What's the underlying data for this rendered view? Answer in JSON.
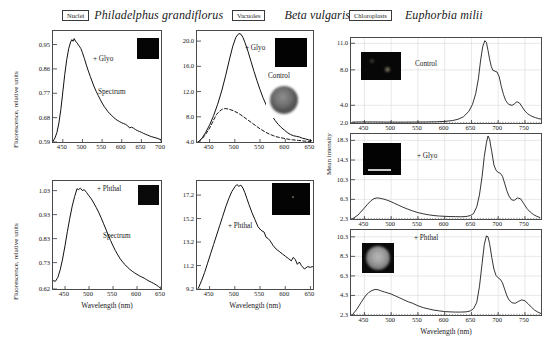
{
  "figure": {
    "columns": [
      {
        "tag": "Nuclei",
        "species": "Philadelphus grandiflorus"
      },
      {
        "tag": "Vacuoles",
        "species": "Beta vulgaris"
      },
      {
        "tag": "Chloroplasts",
        "species": "Euphorbia milii"
      }
    ],
    "axis_labels": {
      "x": "Wavelength (nm)",
      "y_left": "Fluorescence, relative units",
      "y_right": "Mean intensity"
    }
  },
  "chart_data": [
    {
      "id": "philadelphus-glyo",
      "type": "line",
      "title": "Nuclei — Philadelphus grandiflorus, + Glyo",
      "xlabel": "Wavelength (nm)",
      "ylabel": "Fluorescence, relative units",
      "xlim": [
        425,
        700
      ],
      "ylim": [
        0.59,
        1.0
      ],
      "xticks": [
        450,
        500,
        550,
        600,
        650,
        700
      ],
      "yticks": [
        0.59,
        0.68,
        0.77,
        0.86,
        0.95
      ],
      "grid": false,
      "annotations": [
        "+ Glyo",
        "Spectrum"
      ],
      "inset": {
        "kind": "dark-field",
        "label": ""
      },
      "series": [
        {
          "name": "+ Glyo",
          "style": "solid",
          "x": [
            425,
            430,
            435,
            440,
            445,
            450,
            455,
            460,
            465,
            470,
            473,
            476,
            479,
            482,
            485,
            488,
            492,
            496,
            500,
            505,
            510,
            515,
            520,
            525,
            530,
            535,
            540,
            545,
            550,
            555,
            560,
            565,
            570,
            575,
            580,
            585,
            590,
            595,
            600,
            605,
            610,
            615,
            620,
            625,
            630,
            635,
            640,
            645,
            650,
            655,
            660,
            665,
            670,
            675,
            680,
            685,
            690,
            695,
            700
          ],
          "y": [
            0.592,
            0.605,
            0.625,
            0.66,
            0.71,
            0.775,
            0.84,
            0.895,
            0.935,
            0.96,
            0.968,
            0.962,
            0.972,
            0.963,
            0.958,
            0.952,
            0.944,
            0.935,
            0.92,
            0.898,
            0.874,
            0.852,
            0.832,
            0.812,
            0.793,
            0.777,
            0.762,
            0.748,
            0.734,
            0.722,
            0.712,
            0.702,
            0.694,
            0.687,
            0.68,
            0.674,
            0.669,
            0.665,
            0.661,
            0.658,
            0.655,
            0.65,
            0.642,
            0.645,
            0.641,
            0.636,
            0.632,
            0.629,
            0.626,
            0.622,
            0.619,
            0.616,
            0.613,
            0.61,
            0.608,
            0.606,
            0.604,
            0.601,
            0.598
          ]
        }
      ]
    },
    {
      "id": "philadelphus-phthal",
      "type": "line",
      "title": "Nuclei — Philadelphus grandiflorus, + Phthal",
      "xlabel": "Wavelength (nm)",
      "ylabel": "Fluorescence, relative units",
      "xlim": [
        425,
        650
      ],
      "ylim": [
        0.62,
        1.07
      ],
      "xticks": [
        450,
        500,
        550,
        600,
        650
      ],
      "yticks": [
        0.62,
        0.73,
        0.83,
        0.93,
        1.03
      ],
      "grid": false,
      "annotations": [
        "+ Phthal",
        "Spectrum"
      ],
      "inset": {
        "kind": "dark-field",
        "label": ""
      },
      "series": [
        {
          "name": "+ Phthal",
          "style": "solid",
          "x": [
            425,
            430,
            435,
            440,
            445,
            450,
            455,
            460,
            465,
            470,
            475,
            478,
            482,
            486,
            490,
            495,
            500,
            505,
            510,
            515,
            520,
            525,
            530,
            535,
            540,
            545,
            550,
            555,
            560,
            565,
            570,
            575,
            580,
            585,
            590,
            595,
            600,
            605,
            610,
            615,
            620,
            625,
            630,
            635,
            640,
            645,
            650
          ],
          "y": [
            0.655,
            0.652,
            0.668,
            0.7,
            0.745,
            0.8,
            0.86,
            0.915,
            0.965,
            1.005,
            1.038,
            1.034,
            1.04,
            1.03,
            1.034,
            1.022,
            1.008,
            0.995,
            0.978,
            0.96,
            0.94,
            0.918,
            0.894,
            0.87,
            0.845,
            0.822,
            0.8,
            0.78,
            0.762,
            0.746,
            0.733,
            0.721,
            0.711,
            0.702,
            0.694,
            0.687,
            0.681,
            0.675,
            0.67,
            0.665,
            0.659,
            0.653,
            0.648,
            0.643,
            0.637,
            0.63,
            0.622
          ]
        }
      ]
    },
    {
      "id": "beta-glyo-control",
      "type": "line",
      "title": "Vacuoles — Beta vulgaris, + Glyo vs Control",
      "xlabel": "Wavelength (nm)",
      "ylabel": "",
      "xlim": [
        425,
        655
      ],
      "ylim": [
        4.0,
        21.6
      ],
      "xticks": [
        450,
        500,
        550,
        600,
        650
      ],
      "yticks": [
        4.0,
        8.0,
        12.0,
        16.0,
        20.0
      ],
      "grid": false,
      "annotations": [
        "+ Glyo",
        "Control"
      ],
      "inset": {
        "kind": "dark-field",
        "label": ""
      },
      "inset2": {
        "kind": "round-cell",
        "label": ""
      },
      "series": [
        {
          "name": "+ Glyo",
          "style": "solid",
          "x": [
            428,
            435,
            442,
            450,
            458,
            466,
            474,
            482,
            490,
            496,
            502,
            508,
            512,
            516,
            520,
            526,
            532,
            538,
            544,
            550,
            556,
            562,
            568,
            574,
            580,
            586,
            592,
            598,
            604,
            610,
            616,
            622,
            628,
            634,
            640,
            646,
            652
          ],
          "y": [
            4.05,
            4.6,
            5.5,
            6.7,
            8.2,
            10.0,
            12.1,
            14.6,
            17.3,
            19.2,
            20.6,
            21.2,
            21.1,
            20.6,
            19.8,
            18.4,
            16.8,
            15.2,
            13.7,
            12.3,
            11.0,
            9.9,
            8.9,
            8.1,
            7.4,
            6.8,
            6.3,
            5.9,
            5.5,
            5.2,
            5.0,
            4.9,
            4.8,
            4.6,
            4.5,
            4.35,
            4.2
          ]
        },
        {
          "name": "Control",
          "style": "dashed",
          "x": [
            428,
            435,
            442,
            450,
            458,
            464,
            470,
            476,
            482,
            488,
            494,
            500,
            506,
            512,
            518,
            524,
            530,
            536,
            542,
            548,
            554,
            560,
            566,
            572,
            578,
            584,
            590,
            596,
            602,
            608,
            614,
            620,
            626,
            632,
            638,
            644,
            650
          ],
          "y": [
            4.05,
            4.5,
            5.2,
            6.2,
            7.5,
            8.4,
            8.9,
            9.25,
            9.3,
            9.2,
            9.05,
            8.85,
            8.6,
            8.3,
            7.95,
            7.6,
            7.25,
            6.9,
            6.55,
            6.2,
            5.9,
            5.6,
            5.35,
            5.15,
            4.95,
            4.8,
            4.7,
            4.6,
            4.5,
            4.42,
            4.35,
            4.3,
            4.25,
            4.2,
            4.15,
            4.12,
            4.1
          ]
        }
      ]
    },
    {
      "id": "beta-phthal",
      "type": "line",
      "title": "Vacuoles — Beta vulgaris, + Phthal",
      "xlabel": "Wavelength (nm)",
      "ylabel": "",
      "xlim": [
        425,
        655
      ],
      "ylim": [
        9.2,
        18.4
      ],
      "xticks": [
        450,
        500,
        550,
        600,
        650
      ],
      "yticks": [
        9.2,
        11.2,
        13.2,
        15.2,
        17.2
      ],
      "grid": false,
      "annotations": [
        "+ Phthal"
      ],
      "inset": {
        "kind": "dark-field-dot",
        "label": ""
      },
      "series": [
        {
          "name": "+ Phthal",
          "style": "solid",
          "x": [
            428,
            434,
            440,
            446,
            452,
            458,
            464,
            470,
            476,
            482,
            488,
            494,
            500,
            504,
            508,
            512,
            516,
            520,
            524,
            528,
            534,
            540,
            546,
            552,
            558,
            562,
            566,
            570,
            576,
            582,
            588,
            594,
            600,
            606,
            612,
            616,
            620,
            624,
            628,
            632,
            638,
            644,
            650,
            654
          ],
          "y": [
            9.3,
            9.9,
            10.6,
            11.4,
            12.2,
            13.0,
            13.8,
            14.6,
            15.4,
            16.2,
            16.9,
            17.5,
            17.9,
            18.1,
            17.95,
            18.05,
            17.8,
            17.4,
            16.9,
            16.4,
            15.7,
            15.1,
            14.5,
            14.2,
            14.05,
            13.6,
            13.5,
            13.3,
            12.9,
            12.6,
            12.4,
            12.2,
            12.0,
            11.8,
            11.6,
            11.9,
            11.7,
            11.3,
            11.5,
            11.2,
            10.9,
            11.1,
            11.05,
            11.1
          ]
        }
      ]
    },
    {
      "id": "euphorbia-control",
      "type": "line",
      "title": "Chloroplasts — Euphorbia milii, Control",
      "xlabel": "Wavelength (nm)",
      "ylabel": "Mean intensity",
      "xlim": [
        425,
        780
      ],
      "ylim": [
        2.0,
        11.6
      ],
      "xticks": [
        450,
        500,
        550,
        600,
        650,
        700,
        750
      ],
      "yticks": [
        2.0,
        4.0,
        8.0,
        11.0
      ],
      "grid": true,
      "annotations": [
        "Control"
      ],
      "inset": {
        "kind": "dark-field-speck",
        "label": ""
      },
      "series": [
        {
          "name": "Control",
          "style": "solid",
          "x": [
            428,
            445,
            465,
            485,
            505,
            525,
            545,
            565,
            585,
            600,
            615,
            625,
            635,
            645,
            652,
            658,
            663,
            667,
            671,
            675,
            678,
            681,
            684,
            687,
            690,
            694,
            698,
            702,
            706,
            710,
            714,
            718,
            722,
            726,
            730,
            735,
            740,
            745,
            750,
            755,
            760,
            765,
            770,
            775,
            780
          ],
          "y": [
            2.1,
            2.12,
            2.12,
            2.11,
            2.1,
            2.1,
            2.11,
            2.12,
            2.14,
            2.18,
            2.28,
            2.42,
            2.7,
            3.3,
            4.1,
            5.3,
            7.0,
            9.0,
            10.6,
            11.3,
            11.1,
            10.2,
            9.2,
            8.4,
            7.95,
            7.85,
            7.75,
            7.2,
            6.1,
            5.2,
            4.55,
            4.2,
            4.05,
            4.0,
            4.15,
            4.4,
            4.25,
            3.8,
            3.35,
            3.05,
            2.85,
            2.7,
            2.6,
            2.5,
            2.45
          ]
        }
      ]
    },
    {
      "id": "euphorbia-glyo",
      "type": "line",
      "title": "Chloroplasts — Euphorbia milii, + Glyo",
      "xlabel": "Wavelength (nm)",
      "ylabel": "Mean intensity",
      "xlim": [
        425,
        780
      ],
      "ylim": [
        2.3,
        19.6
      ],
      "xticks": [
        450,
        500,
        550,
        600,
        650,
        700,
        750
      ],
      "yticks": [
        2.3,
        6.3,
        10.3,
        14.3,
        18.3
      ],
      "grid": true,
      "annotations": [
        "+ Glyo"
      ],
      "inset": {
        "kind": "dark-field-bar",
        "label": ""
      },
      "series": [
        {
          "name": "+ Glyo",
          "style": "solid",
          "x": [
            428,
            438,
            448,
            456,
            462,
            468,
            474,
            480,
            486,
            492,
            498,
            506,
            514,
            522,
            530,
            540,
            550,
            560,
            570,
            580,
            590,
            600,
            610,
            620,
            630,
            640,
            648,
            654,
            660,
            665,
            670,
            674,
            678,
            681,
            684,
            688,
            692,
            696,
            700,
            704,
            708,
            712,
            716,
            720,
            725,
            730,
            736,
            742,
            748,
            754,
            760,
            766,
            772,
            778
          ],
          "y": [
            2.35,
            3.1,
            4.3,
            5.3,
            6.0,
            6.45,
            6.6,
            6.5,
            6.35,
            6.15,
            5.9,
            5.5,
            5.1,
            4.7,
            4.35,
            3.95,
            3.6,
            3.35,
            3.15,
            3.0,
            2.9,
            2.85,
            2.8,
            2.78,
            2.76,
            2.8,
            3.0,
            3.4,
            4.8,
            7.2,
            11.0,
            15.0,
            17.8,
            19.2,
            18.5,
            16.0,
            13.3,
            12.2,
            11.8,
            11.6,
            11.0,
            9.6,
            8.1,
            7.0,
            6.2,
            6.1,
            6.6,
            6.4,
            5.4,
            4.4,
            3.7,
            3.2,
            2.85,
            2.6
          ]
        }
      ]
    },
    {
      "id": "euphorbia-phthal",
      "type": "line",
      "title": "Chloroplasts — Euphorbia milii, + Phthal",
      "xlabel": "Wavelength (nm)",
      "ylabel": "Mean intensity",
      "xlim": [
        425,
        780
      ],
      "ylim": [
        2.3,
        11.0
      ],
      "xticks": [
        450,
        500,
        550,
        600,
        650,
        700,
        750
      ],
      "yticks": [
        2.3,
        4.3,
        6.3,
        8.3,
        10.3
      ],
      "grid": true,
      "annotations": [
        "+ Phthal"
      ],
      "inset": {
        "kind": "round-cell-grey",
        "label": ""
      },
      "series": [
        {
          "name": "+ Phthal",
          "style": "solid",
          "x": [
            428,
            436,
            444,
            452,
            458,
            464,
            470,
            476,
            482,
            488,
            494,
            500,
            508,
            516,
            524,
            532,
            540,
            550,
            560,
            570,
            580,
            590,
            600,
            610,
            620,
            630,
            640,
            648,
            654,
            660,
            665,
            670,
            674,
            678,
            681,
            684,
            688,
            692,
            696,
            700,
            704,
            708,
            712,
            716,
            720,
            726,
            732,
            738,
            744,
            750,
            756,
            762,
            768,
            774,
            780
          ],
          "y": [
            2.35,
            2.9,
            3.6,
            4.25,
            4.6,
            4.8,
            4.92,
            4.88,
            4.75,
            4.65,
            4.55,
            4.45,
            4.25,
            4.05,
            3.85,
            3.65,
            3.5,
            3.25,
            3.05,
            2.92,
            2.8,
            2.72,
            2.65,
            2.62,
            2.6,
            2.6,
            2.62,
            2.72,
            2.95,
            3.6,
            5.2,
            7.6,
            9.5,
            10.4,
            10.3,
            9.6,
            8.2,
            7.0,
            6.35,
            6.1,
            5.95,
            5.6,
            4.95,
            4.3,
            3.85,
            3.55,
            3.5,
            3.7,
            3.85,
            3.75,
            3.45,
            3.1,
            2.8,
            2.6,
            2.45
          ]
        }
      ]
    }
  ]
}
